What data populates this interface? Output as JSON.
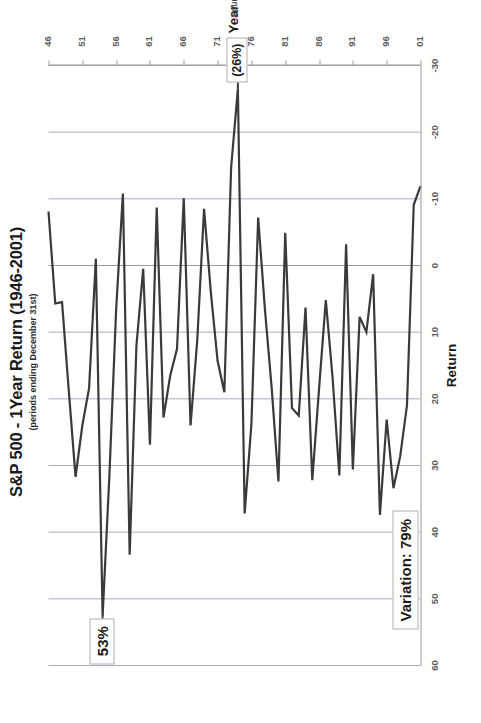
{
  "chart_data": {
    "type": "line",
    "title": "S&P 500 - 1Year Return (1946-2001)",
    "subtitle": "(periods ending December 31st)",
    "xlabel": "Year",
    "ylabel": "Return",
    "source": "Source: Ibbotson Associates",
    "grid": true,
    "legend": "none",
    "orientation": "rotated-90-ccw",
    "xlim": [
      1946,
      2001
    ],
    "ylim": [
      -30,
      60
    ],
    "ytick_labels": [
      "60",
      "50",
      "40",
      "30",
      "20",
      "10",
      "0",
      "-10",
      "-20",
      "-30"
    ],
    "yticks": [
      60,
      50,
      40,
      30,
      20,
      10,
      0,
      -10,
      -20,
      -30
    ],
    "xtick_labels": [
      "46",
      "51",
      "56",
      "61",
      "66",
      "71",
      "76",
      "81",
      "86",
      "91",
      "96",
      "01"
    ],
    "xticks": [
      1946,
      1951,
      1956,
      1961,
      1966,
      1971,
      1976,
      1981,
      1986,
      1991,
      1996,
      2001
    ],
    "x": [
      1946,
      1947,
      1948,
      1949,
      1950,
      1951,
      1952,
      1953,
      1954,
      1955,
      1956,
      1957,
      1958,
      1959,
      1960,
      1961,
      1962,
      1963,
      1964,
      1965,
      1966,
      1967,
      1968,
      1969,
      1970,
      1971,
      1972,
      1973,
      1974,
      1975,
      1976,
      1977,
      1978,
      1979,
      1980,
      1981,
      1982,
      1983,
      1984,
      1985,
      1986,
      1987,
      1988,
      1989,
      1990,
      1991,
      1992,
      1993,
      1994,
      1995,
      1996,
      1997,
      1998,
      1999,
      2000,
      2001
    ],
    "values": [
      -8.1,
      5.7,
      5.5,
      18.8,
      31.7,
      24.0,
      18.4,
      -1.0,
      52.6,
      31.6,
      6.6,
      -10.8,
      43.4,
      12.0,
      0.5,
      26.9,
      -8.7,
      22.8,
      16.5,
      12.5,
      -10.1,
      24.0,
      11.1,
      -8.5,
      4.0,
      14.3,
      19.0,
      -14.7,
      -26.5,
      37.2,
      23.8,
      -7.2,
      6.6,
      18.4,
      32.4,
      -4.9,
      21.4,
      22.5,
      6.3,
      32.2,
      18.5,
      5.2,
      16.8,
      31.5,
      -3.2,
      30.6,
      7.7,
      10.0,
      1.3,
      37.4,
      23.1,
      33.4,
      28.6,
      21.0,
      -9.1,
      -11.9
    ],
    "annotations": [
      {
        "name": "peak-53",
        "label": "53%",
        "year": 1954,
        "value": 52.6
      },
      {
        "name": "trough-26",
        "label": "(26%)",
        "year": 1974,
        "value": -26.5
      },
      {
        "name": "variation",
        "label": "Variation: 79%",
        "year": 1999,
        "value": 45
      }
    ]
  },
  "axis": {
    "y_title": "Return",
    "x_title": "Year"
  }
}
